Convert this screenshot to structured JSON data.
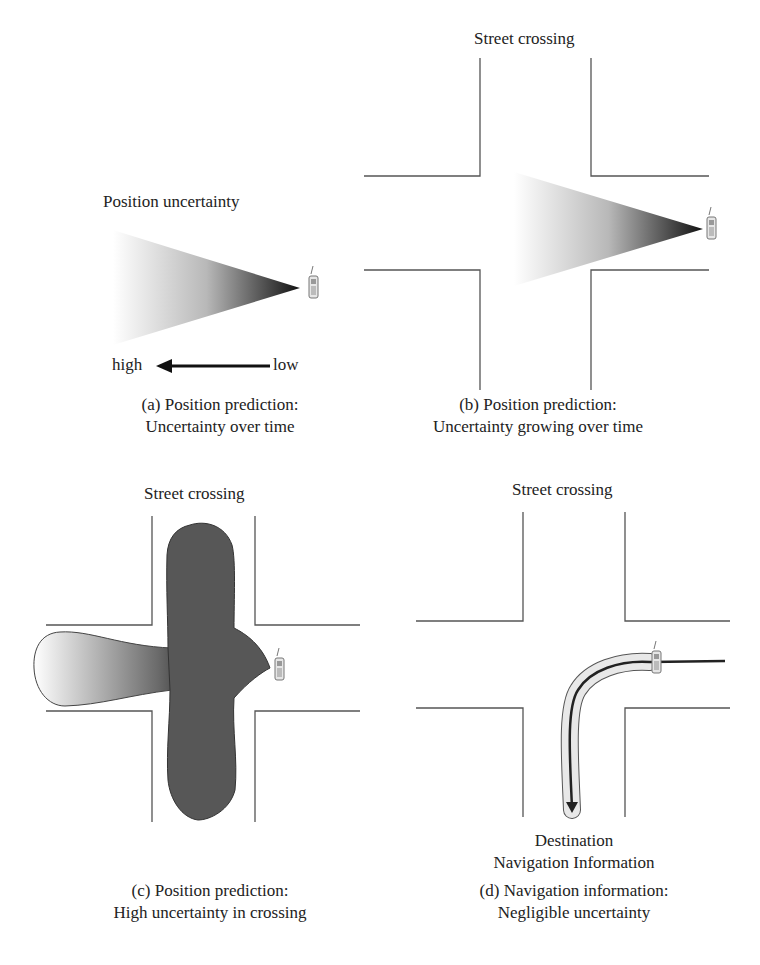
{
  "panels": {
    "a": {
      "title": "Position uncertainty",
      "high": "high",
      "low": "low",
      "caption_line1": "(a) Position prediction:",
      "caption_line2": "Uncertainty over time"
    },
    "b": {
      "title": "Street crossing",
      "caption_line1": "(b) Position prediction:",
      "caption_line2": "Uncertainty growing over time"
    },
    "c": {
      "title": "Street crossing",
      "caption_line1": "(c) Position prediction:",
      "caption_line2": "High uncertainty in crossing"
    },
    "d": {
      "title": "Street crossing",
      "destination": "Destination",
      "nav_info": "Navigation Information",
      "caption_line1": "(d) Navigation information:",
      "caption_line2": "Negligible uncertainty"
    }
  },
  "icons": [
    "mobile-phone-icon",
    "arrow-left-icon",
    "arrow-down-icon"
  ],
  "colors": {
    "line": "#555555",
    "dark_fill": "#555555",
    "light_fill": "#f4f4f4"
  }
}
